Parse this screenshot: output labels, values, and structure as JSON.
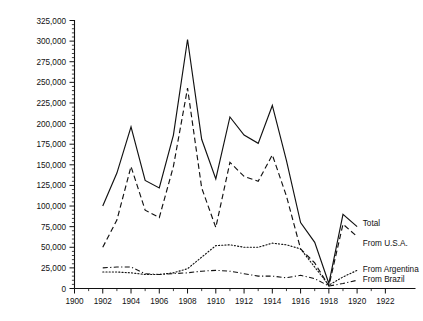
{
  "chart_data": {
    "type": "line",
    "title": "",
    "subtitle": "",
    "xlabel": "",
    "ylabel": "",
    "xlim": [
      1900,
      1923
    ],
    "ylim": [
      0,
      325000
    ],
    "grid": false,
    "legend_position": "right-inline",
    "y_ticks": [
      0,
      25000,
      50000,
      75000,
      100000,
      125000,
      150000,
      175000,
      200000,
      225000,
      250000,
      275000,
      300000,
      325000
    ],
    "y_tick_labels": [
      "0",
      "25,000",
      "50,000",
      "75,000",
      "100,000",
      "125,000",
      "150,000",
      "175,000",
      "200,000",
      "225,000",
      "250,000",
      "275,000",
      "300,000",
      "325,000"
    ],
    "x_ticks": [
      1900,
      1902,
      1904,
      1906,
      1908,
      1910,
      1912,
      1914,
      1916,
      1918,
      1920,
      1922
    ],
    "x_tick_labels": [
      "1900",
      "1902",
      "1904",
      "1906",
      "1908",
      "1910",
      "1912",
      "1914",
      "1916",
      "1918",
      "1920",
      "1922"
    ],
    "x_minor_step": 1,
    "y_minor_step": 5000,
    "x": [
      1902,
      1903,
      1904,
      1905,
      1906,
      1907,
      1908,
      1909,
      1910,
      1911,
      1912,
      1913,
      1914,
      1915,
      1916,
      1917,
      1918,
      1919,
      1920
    ],
    "series": [
      {
        "name": "Total",
        "style": "solid",
        "color": "#111111",
        "label": "Total",
        "values": [
          100000,
          140000,
          196000,
          131000,
          122000,
          186000,
          302000,
          181000,
          133000,
          208000,
          186000,
          176000,
          222000,
          155000,
          80000,
          56000,
          6000,
          90000,
          75000
        ]
      },
      {
        "name": "From U.S.A.",
        "style": "dashed",
        "color": "#111111",
        "label": "From U.S.A.",
        "values": [
          50000,
          83000,
          148000,
          95000,
          86000,
          148000,
          243000,
          122000,
          74000,
          153000,
          136000,
          130000,
          162000,
          112000,
          48000,
          31000,
          3000,
          78000,
          63000
        ]
      },
      {
        "name": "From Argentina",
        "style": "dotted",
        "color": "#111111",
        "label": "From Argentina",
        "values": [
          20000,
          20000,
          19000,
          17000,
          17000,
          19000,
          24000,
          38000,
          52000,
          53000,
          50000,
          50000,
          55000,
          53000,
          48000,
          26000,
          4000,
          14000,
          22000
        ]
      },
      {
        "name": "From Brazil",
        "style": "dashdot",
        "color": "#111111",
        "label": "From Brazil",
        "values": [
          25000,
          26000,
          26000,
          18000,
          17000,
          18000,
          19000,
          21000,
          22000,
          21000,
          18000,
          15000,
          15000,
          13000,
          16000,
          12000,
          3000,
          6000,
          10000
        ]
      }
    ],
    "annotations": [
      {
        "text": "Total",
        "year": 1920.4,
        "value": 80000
      },
      {
        "text": "From U.S.A.",
        "year": 1920.4,
        "value": 55000
      },
      {
        "text": "From Argentina",
        "year": 1920.4,
        "value": 24000
      },
      {
        "text": "From Brazil",
        "year": 1920.4,
        "value": 11000
      }
    ]
  }
}
